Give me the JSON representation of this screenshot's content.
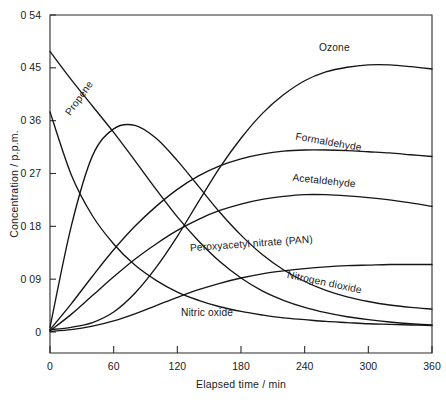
{
  "chart_data": {
    "type": "line",
    "title": "",
    "xlabel": "Elapsed time / min",
    "ylabel": "Concentration / p.p.m.",
    "xlim": [
      0,
      360
    ],
    "ylim": [
      0,
      0.54
    ],
    "grid": false,
    "legend_position": "inline-curve-labels",
    "xticks": [
      "0",
      "60",
      "120",
      "180",
      "240",
      "300",
      "360"
    ],
    "xtick_values": [
      0,
      60,
      120,
      180,
      240,
      300,
      360
    ],
    "yticks": [
      "0",
      "0 09",
      "0 18",
      "0 27",
      "0 36",
      "0 45",
      "0 54"
    ],
    "ytick_values": [
      0,
      0.09,
      0.18,
      0.27,
      0.36,
      0.45,
      0.54
    ],
    "x": [
      0,
      20,
      40,
      60,
      80,
      100,
      120,
      140,
      160,
      180,
      200,
      220,
      240,
      260,
      280,
      300,
      320,
      340,
      360
    ],
    "series": [
      {
        "name": "Propene",
        "label": "Propene",
        "values": [
          0.478,
          0.43,
          0.385,
          0.34,
          0.292,
          0.243,
          0.196,
          0.155,
          0.12,
          0.092,
          0.07,
          0.054,
          0.042,
          0.033,
          0.026,
          0.021,
          0.017,
          0.014,
          0.012
        ]
      },
      {
        "name": "Nitric oxide",
        "label": "Nitric oxide",
        "values": [
          0.375,
          0.268,
          0.198,
          0.15,
          0.114,
          0.088,
          0.068,
          0.054,
          0.043,
          0.035,
          0.029,
          0.024,
          0.021,
          0.018,
          0.016,
          0.014,
          0.013,
          0.012,
          0.011
        ]
      },
      {
        "name": "Nitrogen dioxide",
        "label": "Nitrogen dioxide",
        "values": [
          0.008,
          0.18,
          0.3,
          0.346,
          0.352,
          0.33,
          0.292,
          0.248,
          0.204,
          0.165,
          0.132,
          0.106,
          0.086,
          0.071,
          0.06,
          0.052,
          0.046,
          0.042,
          0.039
        ]
      },
      {
        "name": "Ozone",
        "label": "Ozone",
        "values": [
          0.004,
          0.008,
          0.016,
          0.034,
          0.066,
          0.11,
          0.163,
          0.222,
          0.28,
          0.33,
          0.372,
          0.404,
          0.428,
          0.443,
          0.451,
          0.455,
          0.455,
          0.452,
          0.448
        ]
      },
      {
        "name": "Formaldehyde",
        "label": "Formaldehyde",
        "values": [
          0.004,
          0.048,
          0.095,
          0.14,
          0.18,
          0.214,
          0.243,
          0.266,
          0.283,
          0.295,
          0.303,
          0.308,
          0.31,
          0.31,
          0.309,
          0.307,
          0.305,
          0.302,
          0.299
        ]
      },
      {
        "name": "Acetaldehyde",
        "label": "Acetaldehyde",
        "values": [
          0.002,
          0.03,
          0.062,
          0.094,
          0.124,
          0.15,
          0.173,
          0.192,
          0.207,
          0.218,
          0.226,
          0.231,
          0.234,
          0.234,
          0.232,
          0.229,
          0.225,
          0.22,
          0.214
        ]
      },
      {
        "name": "Peroxyacetyl nitrate (PAN)",
        "label": "Peroxyacetyl nitrate (PAN)",
        "values": [
          0.001,
          0.004,
          0.01,
          0.019,
          0.031,
          0.045,
          0.059,
          0.072,
          0.083,
          0.092,
          0.099,
          0.104,
          0.108,
          0.111,
          0.113,
          0.114,
          0.115,
          0.115,
          0.115
        ]
      }
    ],
    "annotations": [
      {
        "text": "Propene",
        "x": 30,
        "y": 0.395,
        "rotation": -54
      },
      {
        "text": "Ozone",
        "x": 268,
        "y": 0.478,
        "rotation": 0
      },
      {
        "text": "Formaldehyde",
        "x": 262,
        "y": 0.318,
        "rotation": 10
      },
      {
        "text": "Acetaldehyde",
        "x": 258,
        "y": 0.252,
        "rotation": 6
      },
      {
        "text": "Peroxyacetyl nitrate (PAN)",
        "x": 190,
        "y": 0.145,
        "rotation": -4
      },
      {
        "text": "Nitrogen dioxide",
        "x": 258,
        "y": 0.079,
        "rotation": 12
      },
      {
        "text": "Nitric oxide",
        "x": 148,
        "y": 0.027,
        "rotation": 0
      }
    ]
  },
  "colors": {
    "curve": "#151515",
    "axis": "#2b2b2b",
    "background": "#ffffff"
  }
}
